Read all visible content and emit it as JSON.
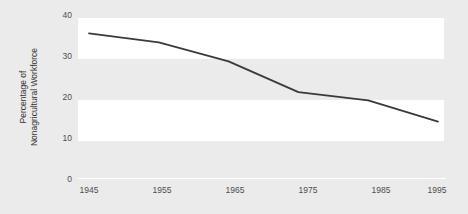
{
  "chart_data": {
    "type": "line",
    "title": "",
    "xlabel": "",
    "ylabel_line1": "Percentage of",
    "ylabel_line2": "Nonagricultural Workforce",
    "x": [
      1945,
      1955,
      1965,
      1975,
      1985,
      1995
    ],
    "categories": [
      "1945",
      "1955",
      "1965",
      "1975",
      "1985",
      "1995"
    ],
    "values": [
      35.5,
      33.3,
      28.7,
      21.2,
      19.2,
      14.0
    ],
    "series": [
      {
        "name": "Percentage of Nonagricultural Workforce",
        "values": [
          35.5,
          33.3,
          28.7,
          21.2,
          19.2,
          14.0
        ],
        "color": "#3a3a3a"
      }
    ],
    "xlim": [
      1945,
      1995
    ],
    "ylim": [
      0,
      40
    ],
    "ytick_labels": [
      "40",
      "30",
      "20",
      "10",
      "0"
    ],
    "ytick_values": [
      40,
      30,
      20,
      10,
      0
    ],
    "xtick_labels": [
      "1945",
      "1955",
      "1965",
      "1975",
      "1985",
      "1995"
    ],
    "grid": false,
    "banded_background": true,
    "legend": "none",
    "plot_background": "#ebebeb",
    "band_color": "#ffffff",
    "line_color": "#3a3a3a",
    "tick_label_color": "#4e4e4e"
  }
}
